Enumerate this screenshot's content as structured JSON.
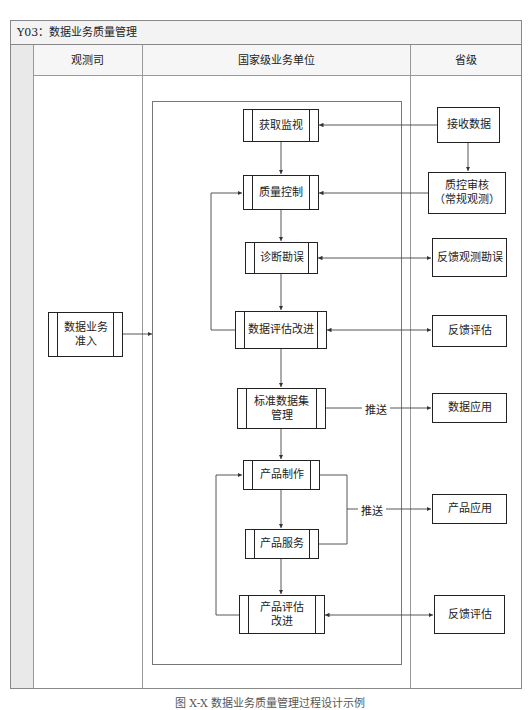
{
  "title": "Y03：数据业务质量管理",
  "columns": [
    {
      "label": "观测司"
    },
    {
      "label": "国家级业务单位"
    },
    {
      "label": "省级"
    }
  ],
  "boxes": {
    "data_access": "数据业务准入",
    "acquire_monitor": "获取监视",
    "quality_control": "质量控制",
    "diagnose_correct": "诊断勘误",
    "data_eval_improve": "数据评估改进",
    "standard_dataset": "标准数据集管理",
    "product_make": "产品制作",
    "product_service": "产品服务",
    "product_eval_improve": "产品评估改进",
    "receive_data": "接收数据",
    "qc_review": "质控审核（常规观测）",
    "feedback_obs_correct": "反馈观测勘误",
    "feedback_eval_1": "反馈评估",
    "data_application": "数据应用",
    "product_application": "产品应用",
    "feedback_eval_2": "反馈评估"
  },
  "box_lines": {
    "data_access": [
      "数据业务",
      "准入"
    ],
    "standard_dataset": [
      "标准数据集",
      "管理"
    ],
    "product_eval_improve": [
      "产品评估",
      "改进"
    ],
    "qc_review": [
      "质控审核",
      "（常规观测）"
    ]
  },
  "edge_labels": {
    "push_1": "推送",
    "push_2": "推送"
  },
  "caption": "图 X-X 数据业务质量管理过程设计示例"
}
